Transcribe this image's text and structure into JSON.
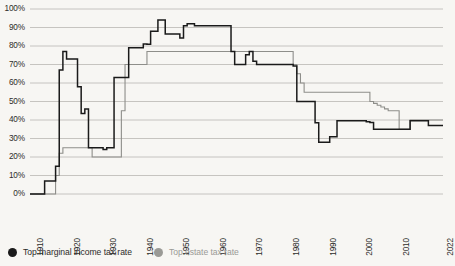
{
  "chart_data": {
    "type": "line",
    "title": "",
    "subtitle": "",
    "xlabel": "",
    "ylabel": "",
    "xlim": [
      1909,
      2022
    ],
    "ylim": [
      0,
      100
    ],
    "grid": true,
    "legend_position": "bottom-left",
    "y_ticks": [
      "0%",
      "10%",
      "20%",
      "30%",
      "40%",
      "50%",
      "60%",
      "70%",
      "80%",
      "90%",
      "100%"
    ],
    "y_tick_values": [
      0,
      10,
      20,
      30,
      40,
      50,
      60,
      70,
      80,
      90,
      100
    ],
    "x_ticks": [
      "1910",
      "1920",
      "1930",
      "1940",
      "1950",
      "1960",
      "1970",
      "1980",
      "1990",
      "2000",
      "2010",
      "2022"
    ],
    "x_tick_values": [
      1910,
      1920,
      1930,
      1940,
      1950,
      1960,
      1970,
      1980,
      1990,
      2000,
      2010,
      2022
    ],
    "colors": {
      "income": "#1a1a1a",
      "estate": "#8e8e8a",
      "grid": "#b9b8b3",
      "background": "#f7f6f3",
      "text": "#2c2b29"
    },
    "series": [
      {
        "name": "Top marginal income tax rate",
        "color": "#1a1a1a",
        "x": [
          1909,
          1912,
          1913,
          1915,
          1916,
          1917,
          1918,
          1919,
          1921,
          1922,
          1923,
          1924,
          1925,
          1928,
          1929,
          1930,
          1931,
          1932,
          1933,
          1935,
          1936,
          1939,
          1940,
          1941,
          1942,
          1943,
          1944,
          1945,
          1946,
          1947,
          1950,
          1951,
          1952,
          1953,
          1954,
          1963,
          1964,
          1965,
          1968,
          1969,
          1970,
          1971,
          1972,
          1976,
          1977,
          1981,
          1982,
          1983,
          1984,
          1986,
          1987,
          1988,
          1990,
          1991,
          1993,
          2001,
          2002,
          2003,
          2012,
          2013,
          2017,
          2018,
          2022
        ],
        "y": [
          0,
          0,
          7,
          7,
          15,
          67,
          77,
          73,
          73,
          58,
          43.5,
          46,
          25,
          25,
          24,
          25,
          25,
          63,
          63,
          63,
          79,
          79,
          81.1,
          81,
          88,
          88,
          94,
          94,
          86.45,
          86.45,
          84.36,
          91,
          92,
          92,
          91,
          91,
          77,
          70,
          75.25,
          77,
          71.75,
          70,
          70,
          70,
          70,
          69.125,
          50,
          50,
          50,
          50,
          38.5,
          28,
          28,
          31,
          39.6,
          39.1,
          38.6,
          35,
          35,
          39.6,
          39.6,
          37,
          37
        ]
      },
      {
        "name": "Top estate tax rate",
        "color": "#8e8e8a",
        "x": [
          1909,
          1915,
          1916,
          1917,
          1918,
          1924,
          1926,
          1932,
          1934,
          1935,
          1940,
          1941,
          1942,
          1954,
          1977,
          1981,
          1982,
          1983,
          1984,
          1985,
          1986,
          1987,
          2001,
          2002,
          2003,
          2004,
          2005,
          2006,
          2007,
          2009,
          2010,
          2011,
          2013,
          2022
        ],
        "y": [
          0,
          0,
          10,
          22,
          25,
          25,
          20,
          20,
          45,
          70,
          70,
          77,
          77,
          77,
          77,
          70,
          65,
          60,
          55,
          55,
          55,
          55,
          55,
          50,
          49,
          48,
          47,
          46,
          45,
          45,
          35,
          35,
          40,
          40
        ]
      }
    ]
  },
  "legend": {
    "items": [
      {
        "label": "Top marginal income tax rate",
        "color": "#1a1a1a",
        "muted": false
      },
      {
        "label": "Top estate tax rate",
        "color": "#9a9a96",
        "muted": true
      }
    ]
  }
}
